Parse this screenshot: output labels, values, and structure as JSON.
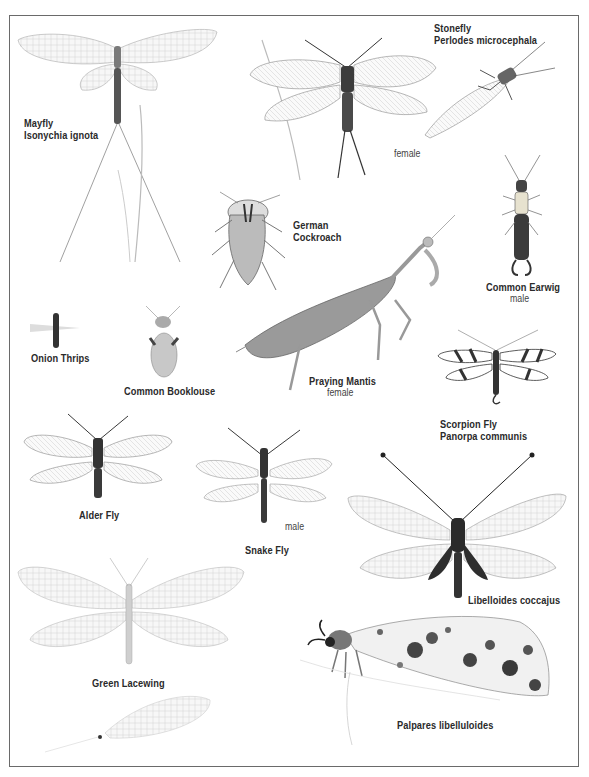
{
  "plate": {
    "title": "",
    "specimens": [
      {
        "id": "mayfly",
        "common": "Mayfly",
        "scientific": "Isonychia ignota",
        "note": ""
      },
      {
        "id": "stonefly",
        "common": "Stonefly",
        "scientific": "Perlodes microcephala",
        "note": "female"
      },
      {
        "id": "german-cockroach",
        "common": "German",
        "common2": "Cockroach",
        "note": ""
      },
      {
        "id": "common-earwig",
        "common": "Common Earwig",
        "note": "male"
      },
      {
        "id": "onion-thrips",
        "common": "Onion Thrips",
        "note": ""
      },
      {
        "id": "common-booklouse",
        "common": "Common Booklouse",
        "note": ""
      },
      {
        "id": "praying-mantis",
        "common": "Praying Mantis",
        "note": "female"
      },
      {
        "id": "scorpion-fly",
        "common": "Scorpion Fly",
        "scientific": "Panorpa communis",
        "note": ""
      },
      {
        "id": "alder-fly",
        "common": "Alder Fly",
        "note": ""
      },
      {
        "id": "snake-fly",
        "common": "Snake Fly",
        "note": "male"
      },
      {
        "id": "libelloides",
        "common": "",
        "scientific": "Libelloides coccajus",
        "note": ""
      },
      {
        "id": "green-lacewing",
        "common": "Green Lacewing",
        "note": ""
      },
      {
        "id": "palpares",
        "common": "",
        "scientific": "Palpares libelluloides",
        "note": ""
      }
    ]
  },
  "colors": {
    "border": "#6a6a6a",
    "ink": "#2a2a2a",
    "wing": "#f4f4f4",
    "wing_vein": "#9a9a9a",
    "body_dark": "#3a3a3a"
  }
}
